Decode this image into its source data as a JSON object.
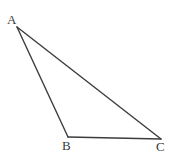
{
  "figure": {
    "name": "triangle-abc",
    "kind": "geometry-diagram",
    "background_color": "#ffffff",
    "stroke_color": "#3d3d3d",
    "stroke_width": 1.4,
    "canvas": {
      "width": 173,
      "height": 156
    }
  },
  "vertices": [
    {
      "id": "A",
      "label": "A",
      "x": 17,
      "y": 27,
      "label_x": 7,
      "label_y": 13
    },
    {
      "id": "B",
      "label": "B",
      "x": 68,
      "y": 137,
      "label_x": 62,
      "label_y": 139
    },
    {
      "id": "C",
      "label": "C",
      "x": 161,
      "y": 139,
      "label_x": 156,
      "label_y": 140
    }
  ],
  "edges": [
    {
      "id": "AB",
      "from": "A",
      "to": "B",
      "x1": 17,
      "y1": 27,
      "x2": 68,
      "y2": 137
    },
    {
      "id": "AC",
      "from": "A",
      "to": "C",
      "x1": 17,
      "y1": 27,
      "x2": 161,
      "y2": 139
    },
    {
      "id": "BC",
      "from": "B",
      "to": "C",
      "x1": 68,
      "y1": 137,
      "x2": 161,
      "y2": 139
    }
  ]
}
